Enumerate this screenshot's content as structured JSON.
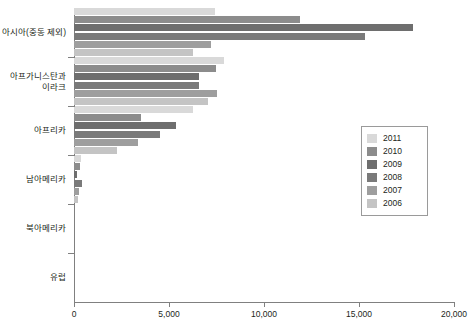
{
  "chart_data": {
    "type": "bar",
    "orientation": "horizontal",
    "title": "",
    "xlabel": "",
    "ylabel": "",
    "xlim": [
      0,
      20000
    ],
    "xticks": [
      0,
      5000,
      10000,
      15000,
      20000
    ],
    "xtick_labels": [
      "0",
      "5,000",
      "10,000",
      "15,000",
      "20,000"
    ],
    "grid": false,
    "legend_position": "right",
    "categories": [
      "아시아(중동 제외)",
      "아프가니스탄과\n이라크",
      "아프리카",
      "남아메리카",
      "북아메리카",
      "유럽"
    ],
    "series": [
      {
        "name": "2011",
        "color": "#d9d9d9",
        "values": [
          7400,
          7900,
          6250,
          350,
          0,
          0
        ]
      },
      {
        "name": "2010",
        "color": "#8c8c8c",
        "values": [
          11900,
          7450,
          3550,
          300,
          0,
          0
        ]
      },
      {
        "name": "2009",
        "color": "#6e6e6e",
        "values": [
          17850,
          6600,
          5350,
          150,
          0,
          0
        ]
      },
      {
        "name": "2008",
        "color": "#7a7a7a",
        "values": [
          15300,
          6600,
          4500,
          400,
          0,
          0
        ]
      },
      {
        "name": "2007",
        "color": "#9e9e9e",
        "values": [
          7200,
          7550,
          3350,
          250,
          0,
          0
        ]
      },
      {
        "name": "2006",
        "color": "#c4c4c4",
        "values": [
          6250,
          7050,
          2250,
          200,
          0,
          0
        ]
      }
    ]
  },
  "legend": {
    "entries": [
      {
        "label": "2011",
        "color": "#d9d9d9"
      },
      {
        "label": "2010",
        "color": "#8c8c8c"
      },
      {
        "label": "2009",
        "color": "#6e6e6e"
      },
      {
        "label": "2008",
        "color": "#7a7a7a"
      },
      {
        "label": "2007",
        "color": "#9e9e9e"
      },
      {
        "label": "2006",
        "color": "#c4c4c4"
      }
    ]
  },
  "axis": {
    "x_labels": [
      "0",
      "5,000",
      "10,000",
      "15,000",
      "20,000"
    ],
    "y_labels": [
      "아시아(중동 제외)",
      "아프가니스탄과\n이라크",
      "아프리카",
      "남아메리카",
      "북아메리카",
      "유럽"
    ]
  },
  "colors": {
    "axis": "#808080",
    "text": "#231f20",
    "background": "#ffffff"
  }
}
